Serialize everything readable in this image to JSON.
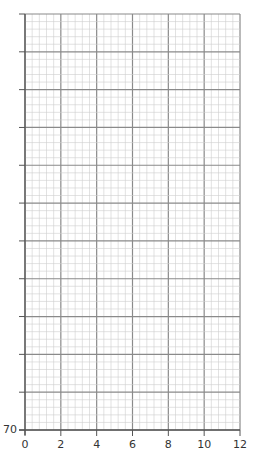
{
  "chart_data": {
    "type": "line",
    "title": "",
    "xlabel": "",
    "ylabel": "",
    "x_ticks": [
      "0",
      "2",
      "4",
      "6",
      "8",
      "10",
      "12"
    ],
    "y_ticks_labeled": [
      "70"
    ],
    "xlim": [
      0,
      12
    ],
    "ylim_min_label": "70",
    "grid": true,
    "series": []
  },
  "axis": {
    "x_labels": [
      "0",
      "2",
      "4",
      "6",
      "8",
      "10",
      "12"
    ],
    "y_label_bottom": "70"
  },
  "colors": {
    "major": "#8a8a8a",
    "minor": "#cfcfcf",
    "axis": "#555555"
  }
}
